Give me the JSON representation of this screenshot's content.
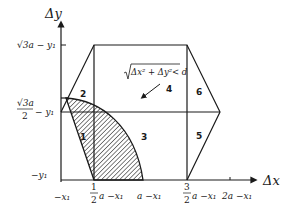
{
  "axes": {
    "x_label": "Δx",
    "y_label": "Δy",
    "x_ticks": [
      {
        "label": "−x₁",
        "x": 61
      },
      {
        "label_top": "1",
        "label_bottom": "2",
        "suffix": "a −x₁",
        "x": 94
      },
      {
        "label": "a −x₁",
        "x": 143
      },
      {
        "label_top": "3",
        "label_bottom": "2",
        "suffix": "a −x₁",
        "x": 187
      },
      {
        "label": "2a −x₁",
        "x": 230
      }
    ],
    "y_ticks": [
      {
        "label": "√3a − y₁",
        "y": 45
      },
      {
        "label_top": "√3a",
        "label_bottom": "2",
        "suffix": "− y₁",
        "y": 112
      },
      {
        "label": "−y₁",
        "y": 180
      }
    ]
  },
  "regions": [
    {
      "id": "1",
      "label": "1"
    },
    {
      "id": "2",
      "label": "2"
    },
    {
      "id": "3",
      "label": "3"
    },
    {
      "id": "4",
      "label": "4"
    },
    {
      "id": "5",
      "label": "5"
    },
    {
      "id": "6",
      "label": "6"
    }
  ],
  "annotation": {
    "formula": "√(Δx² + Δy²) < d",
    "formula_radicand": "Δx² + Δy²",
    "formula_rhs": "< d",
    "points_to_region": "4"
  },
  "colors": {
    "line": "#1a1a1a",
    "hatch": "#1a1a1a",
    "background": "#ffffff"
  }
}
